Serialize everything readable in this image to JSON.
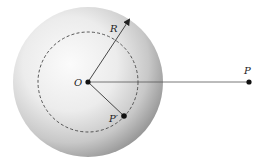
{
  "diagram": {
    "labels": {
      "center": "O",
      "radius": "R",
      "inner_point": "P′",
      "outer_point": "P"
    },
    "colors": {
      "sphere_highlight": "#fafafa",
      "sphere_mid": "#dcdcdc",
      "sphere_shadow": "#8a8a8a",
      "line": "#333333",
      "point": "#111111"
    }
  }
}
